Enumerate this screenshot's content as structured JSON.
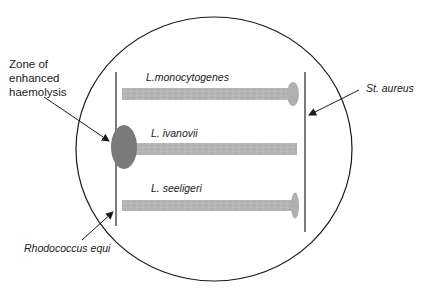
{
  "diagram": {
    "type": "CAMP test streak plate",
    "colors": {
      "plate_outline": "#1a1a1a",
      "streak": "#b3b3b3",
      "streak_texture": "#9e9e9e",
      "haemolysis_zone": "#7a7a7a",
      "line": "#333333",
      "text": "#1a1a1a"
    },
    "labels": {
      "zone": "Zone of\nenhanced\nhaemolysis",
      "l_monocytogenes": "L.monocytogenes",
      "l_ivanovii": "L. ivanovii",
      "l_seeligeri": "L. seeligeri",
      "st_aureus": "St. aureus",
      "rhodococcus_equi": "Rhodococcus equi"
    },
    "elements": {
      "plate": {
        "cx": 214,
        "cy": 149,
        "rx": 138,
        "ry": 132
      },
      "rhodococcus_streak": {
        "x": 116,
        "y1": 72,
        "y2": 226
      },
      "st_aureus_streak": {
        "x": 305,
        "y1": 72,
        "y2": 232
      },
      "enhanced_haemolysis_zone": {
        "cx": 124,
        "cy": 147,
        "rx": 13,
        "ry": 22
      },
      "streaks": [
        {
          "name": "L.monocytogenes",
          "x1": 122,
          "x2": 292,
          "y": 88,
          "h": 12,
          "bulb": true
        },
        {
          "name": "L. ivanovii",
          "x1": 132,
          "x2": 297,
          "y": 143,
          "h": 12,
          "bulb": false
        },
        {
          "name": "L. seeligeri",
          "x1": 122,
          "x2": 292,
          "y": 200,
          "h": 11,
          "bulb": true
        }
      ]
    }
  }
}
